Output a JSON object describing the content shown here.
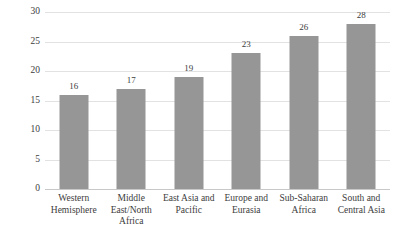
{
  "chart_data": {
    "type": "bar",
    "title": "",
    "subtitle": "",
    "xlabel": "",
    "ylabel": "",
    "ylim": [
      0,
      30
    ],
    "yticks": [
      "0",
      "5",
      "10",
      "15",
      "20",
      "25",
      "30"
    ],
    "ytick_values": [
      0,
      5,
      10,
      15,
      20,
      25,
      30
    ],
    "grid": true,
    "legend": "none",
    "bar_color": "#969696",
    "gridline_color": "#e2e2e2",
    "axis_color": "#c8c8c8",
    "text_color": "#3c3c3c",
    "categories": [
      "Western Hemisphere",
      "Middle East/North Africa",
      "East Asia and Pacific",
      "Europe and Eurasia",
      "Sub-Saharan Africa",
      "South and Central Asia"
    ],
    "category_lines": [
      [
        "Western",
        "Hemisphere"
      ],
      [
        "Middle",
        "East/North",
        "Africa"
      ],
      [
        "East Asia and",
        "Pacific"
      ],
      [
        "Europe and",
        "Eurasia"
      ],
      [
        "Sub-Saharan",
        "Africa"
      ],
      [
        "South and",
        "Central Asia"
      ]
    ],
    "values": [
      16,
      17,
      19,
      23,
      26,
      28
    ],
    "value_labels": [
      "16",
      "17",
      "19",
      "23",
      "26",
      "28"
    ]
  }
}
